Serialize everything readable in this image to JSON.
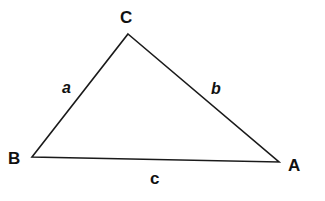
{
  "diagram": {
    "type": "triangle",
    "stroke_color": "#1a1a1a",
    "background": "#ffffff",
    "vertices": {
      "A": {
        "label": "A",
        "x": 279,
        "y": 162
      },
      "B": {
        "label": "B",
        "x": 32,
        "y": 157
      },
      "C": {
        "label": "C",
        "x": 128,
        "y": 34
      }
    },
    "sides": {
      "a": {
        "label": "a",
        "between": "B-C"
      },
      "b": {
        "label": "b",
        "between": "C-A"
      },
      "c": {
        "label": "c",
        "between": "B-A"
      }
    }
  }
}
